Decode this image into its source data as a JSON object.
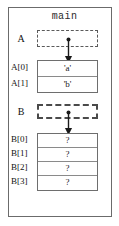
{
  "diagram": {
    "frame_title": "main",
    "colors": {
      "frame_border": "#6b6b6b",
      "table_border": "#6e6e6e",
      "cell_divider": "#8a8a8a",
      "dashed_border": "#5a5a5a",
      "arrow": "#1a1a1a",
      "text": "#111111",
      "background": "#ffffff"
    },
    "variables": [
      {
        "name": "A",
        "pointer_box_style": "dashed",
        "array_label": "A",
        "cells": [
          {
            "index_label": "A[0]",
            "value": "'a'"
          },
          {
            "index_label": "A[1]",
            "value": "'b'"
          }
        ]
      },
      {
        "name": "B",
        "pointer_box_style": "dashed-bold",
        "array_label": "B",
        "cells": [
          {
            "index_label": "B[0]",
            "value": "?"
          },
          {
            "index_label": "B[1]",
            "value": "?"
          },
          {
            "index_label": "B[2]",
            "value": "?"
          },
          {
            "index_label": "B[3]",
            "value": "?"
          }
        ]
      }
    ],
    "arrows": [
      {
        "from": "A",
        "to": "A-array",
        "direction": "down"
      },
      {
        "from": "B",
        "to": "B-array",
        "direction": "down"
      }
    ]
  }
}
